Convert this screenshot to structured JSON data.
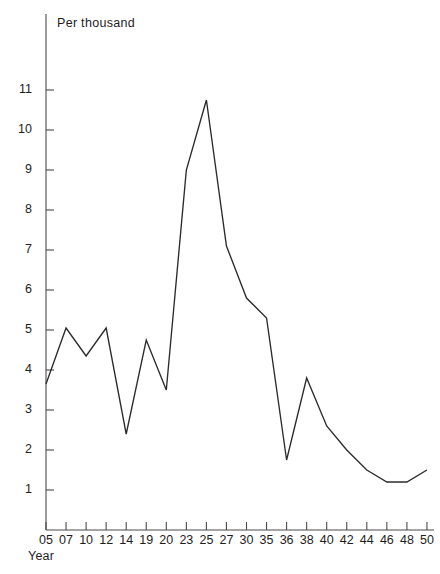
{
  "figure": {
    "cut_off_title": "",
    "y_axis_unit_label": "Per thousand",
    "x_axis_label": "Year"
  },
  "chart_data": {
    "type": "line",
    "title": "",
    "xlabel": "Year",
    "ylabel": "Per thousand",
    "grid": false,
    "legend": false,
    "ylim": [
      0,
      11.4
    ],
    "yticks": [
      1,
      2,
      3,
      4,
      5,
      6,
      7,
      8,
      9,
      10,
      11
    ],
    "ytick_labels": [
      "1",
      "2",
      "3",
      "4",
      "5",
      "6",
      "7",
      "8",
      "9",
      "10",
      "11"
    ],
    "categories": [
      "05",
      "07",
      "10",
      "12",
      "14",
      "19",
      "20",
      "23",
      "25",
      "27",
      "30",
      "35",
      "36",
      "38",
      "40",
      "42",
      "44",
      "46",
      "48",
      "50"
    ],
    "xtick_labels": [
      "05",
      "07",
      "10",
      "12",
      "14",
      "19",
      "20",
      "23",
      "25",
      "27",
      "30",
      "35",
      "36",
      "38",
      "40",
      "42",
      "44",
      "46",
      "48",
      "50"
    ],
    "values": [
      3.65,
      5.05,
      4.35,
      5.05,
      2.4,
      4.75,
      3.5,
      9.0,
      10.75,
      7.1,
      5.8,
      5.3,
      1.75,
      3.8,
      2.6,
      2.0,
      1.5,
      1.2,
      1.2,
      1.5
    ],
    "series": [
      {
        "name": "Per thousand",
        "values": [
          3.65,
          5.05,
          4.35,
          5.05,
          2.4,
          4.75,
          3.5,
          9.0,
          10.75,
          7.1,
          5.8,
          5.3,
          1.75,
          3.8,
          2.6,
          2.0,
          1.5,
          1.2,
          1.2,
          1.5
        ]
      }
    ],
    "line_color": "#2b2b2b",
    "peak": {
      "category": "25",
      "value": 10.75
    },
    "minimum": {
      "category": "46",
      "value": 1.2
    }
  }
}
